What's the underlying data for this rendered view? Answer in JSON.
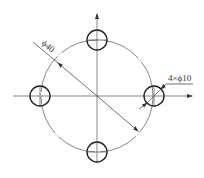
{
  "diagram": {
    "type": "bolt-hole-circle-drawing",
    "pitch_circle_label": "ϕ40",
    "holes_label": "4×ϕ10",
    "hole_count": 4,
    "hole_positions": [
      "top",
      "right",
      "bottom",
      "left"
    ],
    "axes": [
      "horizontal",
      "vertical"
    ],
    "line_color": "#333333",
    "background": "#ffffff"
  }
}
